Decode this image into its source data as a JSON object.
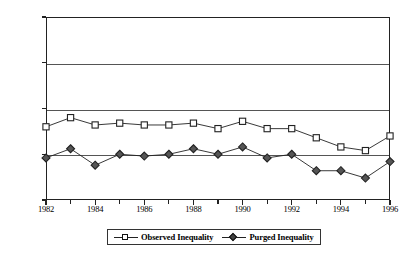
{
  "chart_data": {
    "type": "line",
    "title": "",
    "xlabel": "",
    "ylabel": "",
    "x": [
      1982,
      1983,
      1984,
      1985,
      1986,
      1987,
      1988,
      1989,
      1990,
      1991,
      1992,
      1993,
      1994,
      1995,
      1996
    ],
    "xlim": [
      1982,
      1996
    ],
    "ylim": [
      0.0,
      1.0
    ],
    "yticks": [
      0.0,
      0.25,
      0.5,
      0.75,
      1.0
    ],
    "ytick_labels": [
      "0.00",
      "0.25",
      "0.50",
      "0.75",
      "1.00"
    ],
    "xticks": [
      1982,
      1984,
      1986,
      1988,
      1990,
      1992,
      1994,
      1996
    ],
    "xtick_labels": [
      "1982",
      "1984",
      "1986",
      "1988",
      "1990",
      "1992",
      "1994",
      "1996"
    ],
    "xticks_minor": [
      1983,
      1985,
      1987,
      1989,
      1991,
      1993,
      1995
    ],
    "grid": "horizontal",
    "legend_position": "bottom-center",
    "series": [
      {
        "name": "Observed Inequality",
        "marker": "square",
        "values": [
          0.4,
          0.45,
          0.41,
          0.42,
          0.41,
          0.41,
          0.42,
          0.39,
          0.43,
          0.39,
          0.39,
          0.34,
          0.29,
          0.27,
          0.35
        ]
      },
      {
        "name": "Purged Inequality",
        "marker": "diamond",
        "values": [
          0.23,
          0.28,
          0.19,
          0.25,
          0.24,
          0.25,
          0.28,
          0.25,
          0.29,
          0.23,
          0.25,
          0.16,
          0.16,
          0.12,
          0.21
        ]
      }
    ],
    "colors": {
      "line": "#222222",
      "grid": "#555555",
      "axis": "#222222",
      "marker_face_square": "#ffffff",
      "marker_face_diamond": "#555555",
      "background": "#ffffff"
    }
  },
  "legend": {
    "items": [
      {
        "label": "Observed Inequality",
        "marker": "square"
      },
      {
        "label": "Purged Inequality",
        "marker": "diamond"
      }
    ]
  }
}
